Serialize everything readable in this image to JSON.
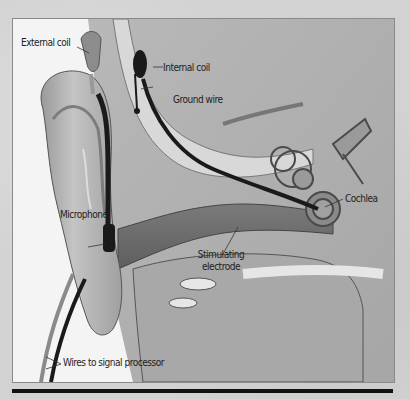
{
  "figure": {
    "labels": {
      "external_coil": "External coil",
      "internal_coil": "Internal coil",
      "ground_wire": "Ground wire",
      "cochlea": "Cochlea",
      "microphone": "Microphone",
      "stimulating_electrode_line1": "Stimulating",
      "stimulating_electrode_line2": "electrode",
      "wires_to_signal_processor": "Wires to signal processor"
    },
    "colors": {
      "background_paper": "#d2d2d2",
      "panel": "#f4f4f4",
      "tissue_light": "#bdbdbd",
      "tissue_mid": "#9e9e9e",
      "tissue_dark": "#6e6e6e",
      "wire": "#1a1a1a",
      "bone_highlight": "#e8e8e8"
    }
  }
}
